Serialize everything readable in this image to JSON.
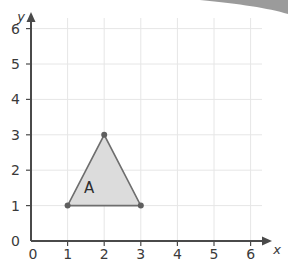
{
  "chart_data": {
    "type": "scatter",
    "title": "",
    "xlabel": "x",
    "ylabel": "y",
    "xlim": [
      0,
      6
    ],
    "ylim": [
      0,
      6
    ],
    "x_ticks": [
      "0",
      "1",
      "2",
      "3",
      "4",
      "5",
      "6"
    ],
    "y_ticks": [
      "0",
      "1",
      "2",
      "3",
      "4",
      "5",
      "6"
    ],
    "grid": true,
    "shapes": [
      {
        "name": "A",
        "type": "triangle",
        "vertices": [
          [
            1,
            1
          ],
          [
            2,
            3
          ],
          [
            3,
            1
          ]
        ],
        "fill": "#dcdcdc",
        "stroke": "#6e6e6e"
      }
    ]
  },
  "colors": {
    "axis": "#4a4a4a",
    "grid": "#e6e6e6",
    "triangle_fill": "#dcdcdc",
    "triangle_stroke": "#6e6e6e",
    "vertex": "#5f5f5f",
    "corner_shadow": "#8a8a8a"
  }
}
